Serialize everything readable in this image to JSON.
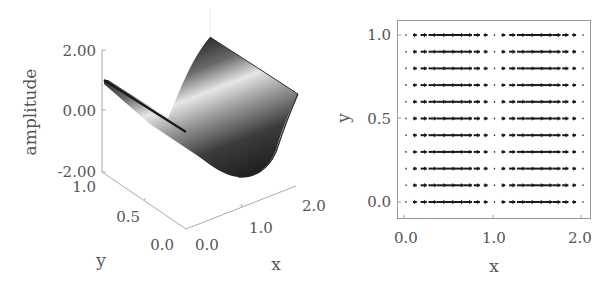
{
  "chart_data": [
    {
      "type": "surface",
      "title": "",
      "xlabel": "x",
      "ylabel": "y",
      "zlabel": "amplitude",
      "xticks": [
        "0.0",
        "1.0",
        "2.0"
      ],
      "yticks": [
        "0.0",
        "0.5",
        "1.0"
      ],
      "zticks": [
        "-2.00",
        "0.00",
        "2.00"
      ],
      "xlim": [
        0,
        2
      ],
      "ylim": [
        0,
        1
      ],
      "zlim": [
        -2,
        2
      ],
      "description": "Surface z = cos(pi*x) varying along x, constant along y (trough near x=1)",
      "colormap": "grayscale"
    },
    {
      "type": "quiver",
      "title": "",
      "xlabel": "x",
      "ylabel": "y",
      "xticks": [
        "0.0",
        "1.0",
        "2.0"
      ],
      "yticks": [
        "0.0",
        "0.5",
        "1.0"
      ],
      "xlim": [
        -0.08,
        2.08
      ],
      "ylim": [
        -0.1,
        1.1
      ],
      "grid_x": [
        0.0,
        0.1,
        0.2,
        0.3,
        0.4,
        0.5,
        0.6,
        0.7,
        0.8,
        0.9,
        1.0,
        1.1,
        1.2,
        1.3,
        1.4,
        1.5,
        1.6,
        1.7,
        1.8,
        1.9,
        2.0
      ],
      "grid_y": [
        0.0,
        0.1,
        0.2,
        0.3,
        0.4,
        0.5,
        0.6,
        0.7,
        0.8,
        0.9,
        1.0
      ],
      "u_description": "horizontal arrows, magnitude ~ |sin(pi*x)|, largest near x=0.5 and x=1.5, near zero at x=0,1,2",
      "v": 0
    }
  ],
  "labels": {
    "left": {
      "zlabel": "amplitude",
      "xlabel": "x",
      "ylabel": "y",
      "zticks": [
        "2.00",
        "0.00",
        "-2.00"
      ],
      "yticks": [
        "1.0",
        "0.5",
        "0.0"
      ],
      "xticks": [
        "0.0",
        "1.0",
        "2.0"
      ]
    },
    "right": {
      "xlabel": "x",
      "ylabel": "y",
      "xticks": [
        "0.0",
        "1.0",
        "2.0"
      ],
      "yticks": [
        "1.0",
        "0.5",
        "0.0"
      ]
    }
  }
}
